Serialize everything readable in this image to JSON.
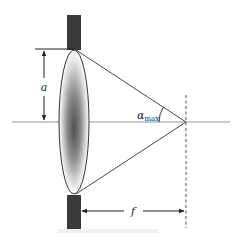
{
  "diagram": {
    "labels": {
      "aperture_radius": "a",
      "max_angle_symbol": "α",
      "max_angle_subscript": "max",
      "focal_length": "f"
    },
    "elements": [
      "upper-aperture-stop",
      "lower-aperture-stop",
      "lens",
      "optical-axis",
      "marginal-ray-upper",
      "marginal-ray-lower",
      "focal-plane",
      "radius-dimension",
      "focal-length-dimension",
      "angle-arc"
    ],
    "colors": {
      "stop_fill": "#3a3a3a",
      "line": "#333333",
      "axis": "#8a8a8a",
      "lens_center": "#555555",
      "lens_edge": "#ffffff"
    }
  }
}
